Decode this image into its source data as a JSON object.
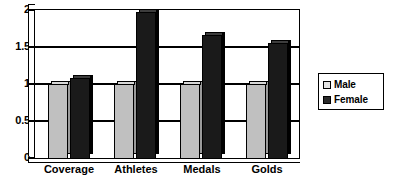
{
  "chart_data": {
    "type": "bar",
    "title": "",
    "subtitle": "",
    "xlabel": "",
    "ylabel": "",
    "categories": [
      "Coverage",
      "Athletes",
      "Medals",
      "Golds"
    ],
    "series": [
      {
        "name": "Male",
        "color": "#C0C0C0",
        "values": [
          1.0,
          1.0,
          1.0,
          1.0
        ]
      },
      {
        "name": "Female",
        "color": "#1A1A1A",
        "values": [
          1.08,
          1.96,
          1.66,
          1.55
        ]
      }
    ],
    "ylim": [
      0,
      2
    ],
    "yticks": [
      0,
      0.5,
      1,
      1.5,
      2
    ],
    "ytick_labels": [
      "0",
      "0.5",
      "1",
      "1.5",
      "2"
    ],
    "grid": true,
    "grid_axis": "y",
    "legend_position": "right",
    "style": "3d-columns"
  },
  "legend": {
    "entries": [
      {
        "label": "Male",
        "swatch": "light-gray"
      },
      {
        "label": "Female",
        "swatch": "black"
      }
    ]
  },
  "axis": {
    "y_labels": [
      "2",
      "1.5",
      "1",
      "0.5",
      "0"
    ],
    "x_labels": [
      "Coverage",
      "Athletes",
      "Medals",
      "Golds"
    ]
  },
  "colors": {
    "male_bar": "#C0C0C0",
    "female_bar": "#1A1A1A",
    "axis": "#000000",
    "plot_background": "#FFFFFF"
  }
}
